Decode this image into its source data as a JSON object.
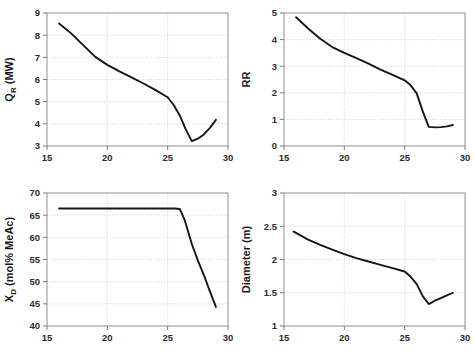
{
  "figure": {
    "title": "",
    "panel_count": 4,
    "shared_xlabel": "",
    "background": "#ffffff",
    "line_color": "#151515",
    "grid_color": "#c9c9c9",
    "frame_color": "#8f8f8f"
  },
  "chart_data": [
    {
      "type": "line",
      "id": "reboiler-duty",
      "title": "",
      "xlabel": "",
      "ylabel": "Q_R (MW)",
      "ylabel_main": "Q",
      "ylabel_sub": "R",
      "ylabel_unit": " (MW)",
      "xlim": [
        15,
        30
      ],
      "ylim": [
        3,
        9
      ],
      "xticks": [
        15,
        20,
        25,
        30
      ],
      "yticks": [
        3,
        4,
        5,
        6,
        7,
        8,
        9
      ],
      "xtick_labels": [
        "15",
        "20",
        "25",
        "30"
      ],
      "ytick_labels": [
        "3",
        "4",
        "5",
        "6",
        "7",
        "8",
        "9"
      ],
      "grid": true,
      "legend": "none",
      "series": [
        {
          "name": "QR",
          "x": [
            16.0,
            17.0,
            18.0,
            19.0,
            20.0,
            21.0,
            22.0,
            23.0,
            24.0,
            25.0,
            25.5,
            26.0,
            26.5,
            27.0,
            27.5,
            28.0,
            28.5,
            29.0
          ],
          "y": [
            8.53,
            8.08,
            7.55,
            7.02,
            6.66,
            6.37,
            6.1,
            5.82,
            5.52,
            5.2,
            4.85,
            4.38,
            3.75,
            3.22,
            3.33,
            3.52,
            3.82,
            4.18
          ]
        }
      ]
    },
    {
      "type": "line",
      "id": "reflux-ratio",
      "title": "",
      "xlabel": "",
      "ylabel": "RR",
      "xlim": [
        15,
        30
      ],
      "ylim": [
        0,
        5
      ],
      "xticks": [
        15,
        20,
        25,
        30
      ],
      "yticks": [
        0,
        1,
        2,
        3,
        4,
        5
      ],
      "xtick_labels": [
        "15",
        "20",
        "25",
        "30"
      ],
      "ytick_labels": [
        "0",
        "1",
        "2",
        "3",
        "4",
        "5"
      ],
      "grid": true,
      "legend": "none",
      "series": [
        {
          "name": "RR",
          "x": [
            16.0,
            17.0,
            18.0,
            19.0,
            20.0,
            21.0,
            22.0,
            23.0,
            24.0,
            25.0,
            25.5,
            26.0,
            26.5,
            27.0,
            27.5,
            28.0,
            28.5,
            29.0
          ],
          "y": [
            4.84,
            4.42,
            4.03,
            3.72,
            3.5,
            3.3,
            3.1,
            2.87,
            2.67,
            2.47,
            2.28,
            1.98,
            1.3,
            0.72,
            0.7,
            0.71,
            0.74,
            0.79
          ]
        }
      ]
    },
    {
      "type": "line",
      "id": "distillate-composition",
      "title": "",
      "xlabel": "",
      "ylabel": "X_D (mol% MeAc)",
      "ylabel_main": "X",
      "ylabel_sub": "D",
      "ylabel_unit": " (mol% MeAc)",
      "xlim": [
        15,
        30
      ],
      "ylim": [
        40,
        70
      ],
      "xticks": [
        15,
        20,
        25,
        30
      ],
      "yticks": [
        40,
        45,
        50,
        55,
        60,
        65,
        70
      ],
      "xtick_labels": [
        "15",
        "20",
        "25",
        "30"
      ],
      "ytick_labels": [
        "40",
        "45",
        "50",
        "55",
        "60",
        "65",
        "70"
      ],
      "grid": true,
      "legend": "none",
      "series": [
        {
          "name": "XD",
          "x": [
            16.0,
            18.0,
            20.0,
            22.0,
            24.0,
            25.0,
            25.6,
            26.0,
            26.4,
            27.0,
            27.5,
            28.0,
            28.5,
            29.0
          ],
          "y": [
            66.5,
            66.5,
            66.5,
            66.5,
            66.5,
            66.5,
            66.5,
            66.4,
            64.0,
            58.5,
            54.8,
            51.5,
            47.8,
            44.3
          ]
        }
      ]
    },
    {
      "type": "line",
      "id": "column-diameter",
      "title": "",
      "xlabel": "",
      "ylabel": "Diameter (m)",
      "xlim": [
        15,
        30
      ],
      "ylim": [
        1,
        3
      ],
      "xticks": [
        15,
        20,
        25,
        30
      ],
      "yticks": [
        1,
        1.5,
        2,
        2.5,
        3
      ],
      "xtick_labels": [
        "15",
        "20",
        "25",
        "30"
      ],
      "ytick_labels": [
        "1",
        "1.5",
        "2",
        "2.5",
        "3"
      ],
      "grid": true,
      "legend": "none",
      "series": [
        {
          "name": "Diameter",
          "x": [
            15.8,
            17.0,
            18.0,
            19.0,
            20.0,
            21.0,
            22.0,
            23.0,
            24.0,
            25.0,
            25.5,
            26.0,
            26.5,
            27.0,
            27.5,
            28.0,
            28.5,
            29.0
          ],
          "y": [
            2.42,
            2.3,
            2.22,
            2.15,
            2.08,
            2.02,
            1.97,
            1.92,
            1.87,
            1.82,
            1.74,
            1.63,
            1.45,
            1.33,
            1.38,
            1.42,
            1.46,
            1.5
          ]
        }
      ]
    }
  ]
}
